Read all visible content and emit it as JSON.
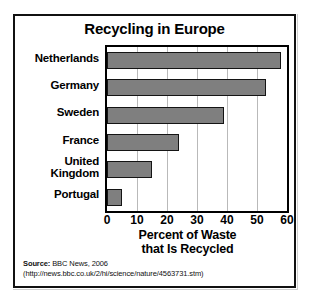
{
  "chart_data": {
    "type": "bar",
    "orientation": "horizontal",
    "title": "Recycling in Europe",
    "categories": [
      "Netherlands",
      "Germany",
      "Sweden",
      "France",
      "United Kingdom",
      "Portugal"
    ],
    "values": [
      58,
      53,
      39,
      24,
      15,
      5
    ],
    "xlabel": "Percent of Waste that Is Recycled",
    "ylabel": "",
    "xlim": [
      0,
      60
    ],
    "xticks": [
      0,
      10,
      20,
      30,
      40,
      50,
      60
    ],
    "grid": "vertical",
    "legend": "none",
    "bar_color": "#7f7f7f",
    "bar_edge_color": "#141414",
    "background": "#ffffff"
  },
  "title": {
    "text": "Recycling in Europe"
  },
  "axis": {
    "x_title_line1": "Percent of Waste",
    "x_title_line2": "that Is Recycled",
    "ticks": [
      "0",
      "10",
      "20",
      "30",
      "40",
      "50",
      "60"
    ]
  },
  "categories": [
    {
      "label": "Netherlands",
      "line1": "Netherlands",
      "line2": "",
      "value": 58
    },
    {
      "label": "Germany",
      "line1": "Germany",
      "line2": "",
      "value": 53
    },
    {
      "label": "Sweden",
      "line1": "Sweden",
      "line2": "",
      "value": 39
    },
    {
      "label": "France",
      "line1": "France",
      "line2": "",
      "value": 24
    },
    {
      "label": "United Kingdom",
      "line1": "United",
      "line2": "Kingdom",
      "value": 15
    },
    {
      "label": "Portugal",
      "line1": "Portugal",
      "line2": "",
      "value": 5
    }
  ],
  "source": {
    "label": "Source:",
    "text": " BBC News, 2006",
    "url": "(http://news.bbc.co.uk/2/hi/science/nature/4563731.stm)"
  }
}
